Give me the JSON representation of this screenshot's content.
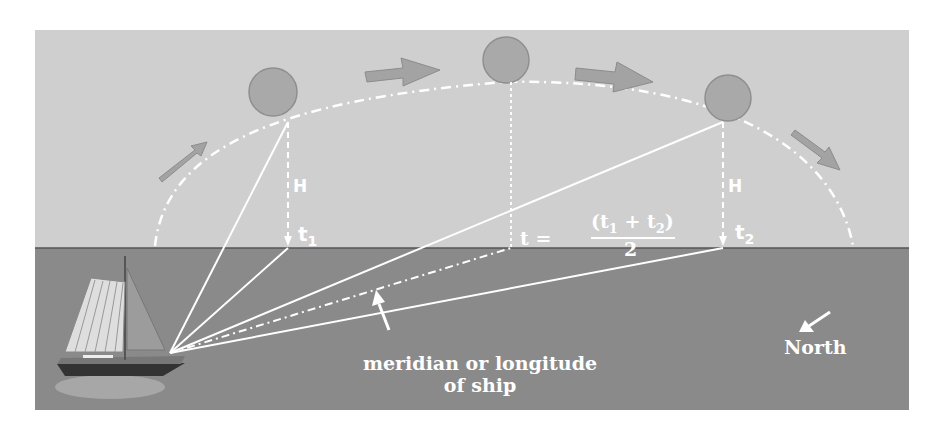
{
  "diagram": {
    "labels": {
      "h_left": "H",
      "h_right": "H",
      "t1": "t",
      "t1_sub": "1",
      "t2": "t",
      "t2_sub": "2",
      "t_mid": "t =",
      "t_mid_numerator": "(t",
      "t_mid_numerator_sub1": "1",
      "t_mid_plus": "+ t",
      "t_mid_numerator_sub2": "2",
      "t_mid_close": ")",
      "t_mid_denominator": "2",
      "meridian_line1": "meridian or longitude",
      "meridian_line2": "of ship",
      "north": "North"
    },
    "colors": {
      "sky": "#cfcfcf",
      "sea": "#8a8a8a",
      "sun": "#a9a9a9",
      "arrow": "#a3a3a3",
      "lines": "#ffffff"
    },
    "elements": {
      "suns": [
        "sun-position-1",
        "sun-noon",
        "sun-position-2"
      ],
      "motion_arrows": 4,
      "ship": "sailing-ship"
    }
  }
}
